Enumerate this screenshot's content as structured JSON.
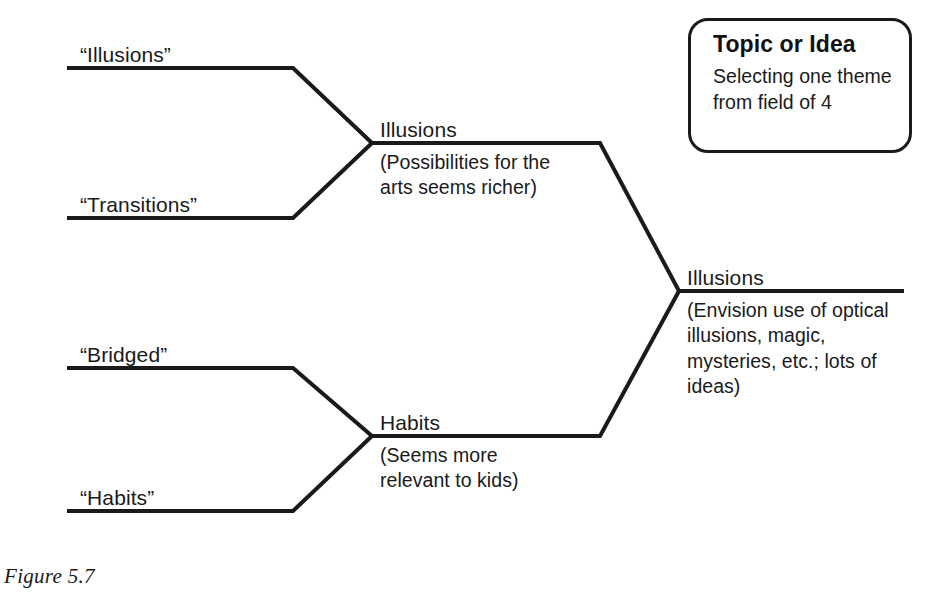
{
  "figure": {
    "caption": "Figure 5.7"
  },
  "callout": {
    "title": "Topic or Idea",
    "body": "Selecting one theme\nfrom field of 4"
  },
  "diagram": {
    "type": "convergence-tree",
    "stroke_color": "#1a1a1a",
    "background_color": "#ffffff",
    "leaves": [
      {
        "label": "“Illusions”",
        "x": 80,
        "y": 58,
        "line_y": 68
      },
      {
        "label": "“Transitions”",
        "x": 80,
        "y": 208,
        "line_y": 218
      },
      {
        "label": "“Bridged”",
        "x": 80,
        "y": 358,
        "line_y": 368
      },
      {
        "label": "“Habits”",
        "x": 80,
        "y": 501,
        "line_y": 511
      }
    ],
    "mid_nodes": [
      {
        "title": "Illusions",
        "desc": "(Possibilities for the\narts seems richer)",
        "title_x": 380,
        "title_y": 120,
        "desc_x": 380,
        "desc_y": 152,
        "line_y": 143
      },
      {
        "title": "Habits",
        "desc": "(Seems more\nrelevant to kids)",
        "title_x": 380,
        "title_y": 413,
        "desc_x": 380,
        "desc_y": 445,
        "line_y": 436
      }
    ],
    "final_node": {
      "title": "Illusions",
      "desc": "(Envision use of optical\nillusions, magic,\nmysteries, etc.; lots of\nideas)",
      "title_x": 687,
      "title_y": 268,
      "desc_x": 687,
      "desc_y": 300,
      "line_y": 291
    }
  }
}
